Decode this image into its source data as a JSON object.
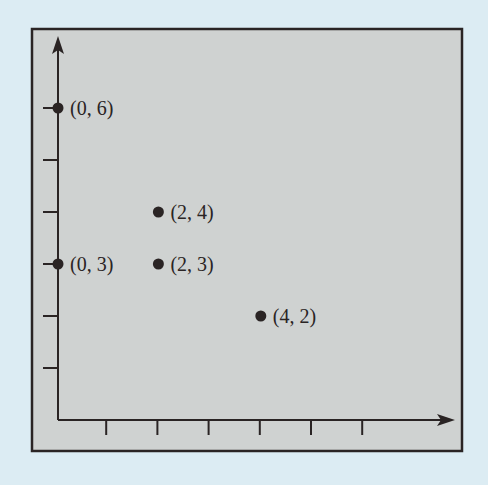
{
  "chart_data": {
    "type": "scatter",
    "title": "",
    "xlabel": "",
    "ylabel": "",
    "xlim": [
      0,
      7
    ],
    "ylim": [
      0,
      7
    ],
    "grid": false,
    "legend": null,
    "x_ticks": [
      1,
      2,
      3,
      4,
      5,
      6
    ],
    "y_ticks": [
      1,
      2,
      3,
      4,
      5,
      6
    ],
    "points": [
      {
        "x": 0,
        "y": 6,
        "label": "(0, 6)"
      },
      {
        "x": 2,
        "y": 4,
        "label": "(2, 4)"
      },
      {
        "x": 0,
        "y": 3,
        "label": "(0, 3)"
      },
      {
        "x": 2,
        "y": 3,
        "label": "(2, 3)"
      },
      {
        "x": 4,
        "y": 2,
        "label": "(4, 2)"
      }
    ]
  },
  "colors": {
    "page_background": "#dcecf3",
    "panel_background": "#cfd2d1",
    "ink": "#2a2424"
  }
}
